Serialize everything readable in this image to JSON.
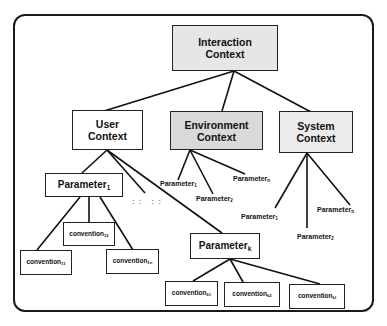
{
  "diagram": {
    "root": {
      "label_line1": "Interaction",
      "label_line2": "Context",
      "fill": "#e6e6e6"
    },
    "user": {
      "label_line1": "User",
      "label_line2": "Context",
      "fill": "#ffffff"
    },
    "environment": {
      "label_line1": "Environment",
      "label_line2": "Context",
      "fill": "#d9d9d9"
    },
    "system": {
      "label_line1": "System",
      "label_line2": "Context",
      "fill": "#ececec"
    },
    "user_params": {
      "p1": {
        "base": "Parameter",
        "sub": "1"
      },
      "pk": {
        "base": "Parameter",
        "sub": "k"
      },
      "ellipsis": ":: ::"
    },
    "user_p1_conventions": [
      {
        "base": "convention",
        "sub": "11"
      },
      {
        "base": "convention",
        "sub": "12"
      },
      {
        "base": "convention",
        "sub": "1n"
      }
    ],
    "user_pk_conventions": [
      {
        "base": "convention",
        "sub": "k1"
      },
      {
        "base": "convention",
        "sub": "k2"
      },
      {
        "base": "convention",
        "sub": "kl"
      }
    ],
    "environment_params": [
      {
        "base": "Parameter",
        "sub": "1"
      },
      {
        "base": "Parameter",
        "sub": "2"
      },
      {
        "base": "Parameter",
        "sub": "n"
      }
    ],
    "system_params": [
      {
        "base": "Parameter",
        "sub": "1"
      },
      {
        "base": "Parameter",
        "sub": "2"
      },
      {
        "base": "Parameter",
        "sub": "n"
      }
    ]
  }
}
